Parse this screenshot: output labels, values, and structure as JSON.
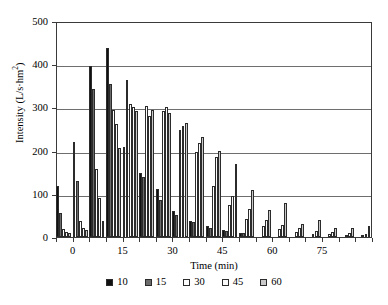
{
  "chart_data": {
    "type": "bar",
    "title": "",
    "xlabel": "Time (min)",
    "ylabel": "Intensity (L/s·hm²)",
    "ylabel_base": "Intensity (L/s·hm",
    "ylabel_sup": "2",
    "ylabel_tail": ")",
    "xlim": [
      -5,
      90
    ],
    "ylim": [
      0,
      500
    ],
    "grid": true,
    "legend_position": "bottom-center",
    "ytick_labels": [
      "0",
      "100",
      "200",
      "300",
      "400",
      "500"
    ],
    "ytick_values": [
      0,
      100,
      200,
      300,
      400,
      500
    ],
    "xtick_labels": [
      "0",
      "15",
      "30",
      "45",
      "60",
      "75"
    ],
    "xtick_values": [
      0,
      15,
      30,
      45,
      60,
      75
    ],
    "x_minor_step": 5,
    "categories": [
      -3,
      2,
      7,
      12,
      17,
      22,
      27,
      32,
      37,
      42,
      47,
      52,
      57,
      62,
      67,
      72,
      77,
      82,
      87
    ],
    "series": [
      {
        "name": "10",
        "color": "#111111",
        "values": [
          118,
          221,
          396,
          437,
          208,
          148,
          112,
          60,
          38,
          25,
          16,
          10,
          0,
          0,
          0,
          0,
          0,
          0,
          0
        ]
      },
      {
        "name": "15",
        "color": "#6b6b6b",
        "values": [
          55,
          129,
          342,
          355,
          364,
          140,
          85,
          52,
          34,
          22,
          14,
          9,
          0,
          0,
          0,
          0,
          0,
          0,
          0
        ]
      },
      {
        "name": "30",
        "color": "#ffffff",
        "values": [
          18,
          38,
          157,
          295,
          309,
          304,
          291,
          248,
          196,
          118,
          75,
          42,
          26,
          18,
          12,
          8,
          6,
          5,
          4
        ]
      },
      {
        "name": "45",
        "color": "#fbfbfb",
        "values": [
          12,
          20,
          90,
          262,
          302,
          281,
          300,
          256,
          218,
          185,
          96,
          66,
          40,
          28,
          20,
          14,
          11,
          9,
          7
        ]
      },
      {
        "name": "60",
        "color": "#c9c9c9",
        "values": [
          10,
          16,
          38,
          205,
          292,
          295,
          286,
          264,
          231,
          198,
          169,
          108,
          62,
          78,
          30,
          40,
          22,
          20,
          26
        ]
      }
    ],
    "legend": [
      {
        "label": "10",
        "color": "#111111"
      },
      {
        "label": "15",
        "color": "#6b6b6b"
      },
      {
        "label": "30",
        "color": "#ffffff"
      },
      {
        "label": "45",
        "color": "#fbfbfb"
      },
      {
        "label": "60",
        "color": "#c9c9c9"
      }
    ]
  }
}
